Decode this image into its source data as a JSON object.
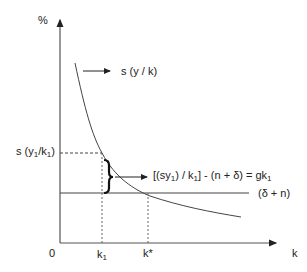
{
  "diagram": {
    "y_axis_label": "%",
    "x_axis_label": "k",
    "origin_label": "0",
    "curve_label": "s (y / k)",
    "line_label": "(δ + n)",
    "y_tick_label": {
      "prefix": "s (y",
      "sub1": "1",
      "mid": "/k",
      "sub2": "1",
      "suffix": ")"
    },
    "x_ticks": [
      {
        "base": "k",
        "sub": "1"
      },
      {
        "base": "k*",
        "sub": ""
      }
    ],
    "gap_label": {
      "p1": "[(sy",
      "s1": "1",
      "p2": ") / k",
      "s2": "1",
      "p3": "] - (n + δ) = gk",
      "s3": "1"
    },
    "colors": {
      "ink": "#222222",
      "background": "#ffffff"
    }
  }
}
